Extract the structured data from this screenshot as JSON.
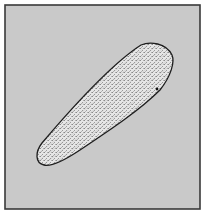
{
  "figure": {
    "colors": {
      "page_background": "#ffffff",
      "panel_fill": "#c9c9c9",
      "panel_border": "#3a3a3a",
      "shape_fill": "#e4e4e4",
      "shape_stipple": "#8a8a8a",
      "shape_outline": "#1e1e1e"
    },
    "panel": {
      "x": 5,
      "y": 5,
      "width": 195,
      "height": 204
    },
    "shape": {
      "type": "tapered-capsule",
      "wide_end": {
        "x": 160,
        "y": 58
      },
      "narrow_end": {
        "x": 40,
        "y": 160
      }
    }
  }
}
